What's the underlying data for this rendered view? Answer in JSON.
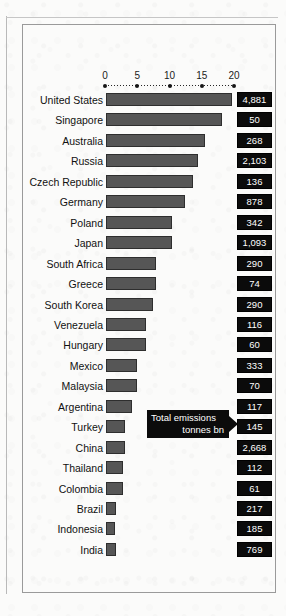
{
  "chart_data": {
    "type": "bar",
    "orientation": "horizontal",
    "title": "",
    "xlabel": "",
    "ylabel": "",
    "xlim": [
      0,
      20
    ],
    "grid": false,
    "axis_ticks": [
      {
        "label": "0",
        "value": 0
      },
      {
        "label": "5",
        "value": 5
      },
      {
        "label": "10",
        "value": 10
      },
      {
        "label": "15",
        "value": 15
      },
      {
        "label": "20",
        "value": 20
      }
    ],
    "annotation": {
      "line1": "Total emissions",
      "line2": "tonnes bn",
      "points_to": "value-column"
    },
    "value_column_label": "Total emissions tonnes bn",
    "categories": [
      "United States",
      "Singapore",
      "Australia",
      "Russia",
      "Czech Republic",
      "Germany",
      "Poland",
      "Japan",
      "South Africa",
      "Greece",
      "South Korea",
      "Venezuela",
      "Hungary",
      "Mexico",
      "Malaysia",
      "Argentina",
      "Turkey",
      "China",
      "Thailand",
      "Colombia",
      "Brazil",
      "Indonesia",
      "India"
    ],
    "values": [
      19.5,
      18.0,
      15.3,
      14.3,
      13.5,
      12.2,
      10.2,
      10.2,
      7.7,
      7.7,
      7.3,
      6.2,
      6.2,
      4.8,
      4.8,
      4.0,
      3.0,
      3.0,
      2.6,
      2.6,
      1.6,
      1.4,
      1.5
    ],
    "total_emissions": [
      "4,881",
      "50",
      "268",
      "2,103",
      "136",
      "878",
      "342",
      "1,093",
      "290",
      "74",
      "290",
      "116",
      "60",
      "333",
      "70",
      "117",
      "145",
      "2,668",
      "112",
      "61",
      "217",
      "185",
      "769"
    ],
    "colors": {
      "bar_fill": "#565656",
      "bar_stroke": "#2e2e2e",
      "value_box_bg": "#0b0b0b",
      "value_box_text": "#ffffff",
      "axis": "#161616",
      "frame": "#9a9a9a",
      "background": "#fbfbfa"
    }
  }
}
